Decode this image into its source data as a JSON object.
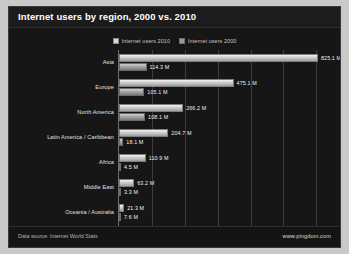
{
  "header": {
    "title": "Internet users by region, 2000 vs. 2010"
  },
  "legend": {
    "position": "top-center",
    "entries": [
      {
        "label": "Internet users 2010",
        "icon": "square-swatch-icon",
        "color": "#d8d8d8"
      },
      {
        "label": "Internet users 2000",
        "icon": "square-swatch-icon",
        "color": "#9a9a9a"
      }
    ]
  },
  "footer": {
    "data_source": "Data source: Internet World Stats",
    "url": "www.pingdom.com"
  },
  "chart_data": {
    "type": "bar",
    "orientation": "horizontal",
    "title": "Internet users by region, 2000 vs. 2010",
    "xlabel": "",
    "ylabel": "",
    "xlim": [
      0,
      900
    ],
    "grid": true,
    "legend_position": "top-center",
    "unit": "M",
    "categories": [
      "Asia",
      "Europe",
      "North America",
      "Latin America / Caribbean",
      "Africa",
      "Middle East",
      "Oceania / Australia"
    ],
    "series": [
      {
        "name": "Internet users 2010",
        "color": "#d8d8d8",
        "values": [
          825.1,
          475.1,
          266.2,
          204.7,
          110.9,
          63.2,
          21.3
        ],
        "labels": [
          "825.1 M",
          "475.1 M",
          "266.2 M",
          "204.7 M",
          "110.9 M",
          "63.2 M",
          "21.3 M"
        ]
      },
      {
        "name": "Internet users 2000",
        "color": "#9a9a9a",
        "values": [
          114.3,
          105.1,
          108.1,
          18.1,
          4.5,
          3.3,
          7.6
        ],
        "labels": [
          "114.3 M",
          "105.1 M",
          "108.1 M",
          "18.1 M",
          "4.5 M",
          "3.3 M",
          "7.6 M"
        ]
      }
    ]
  }
}
